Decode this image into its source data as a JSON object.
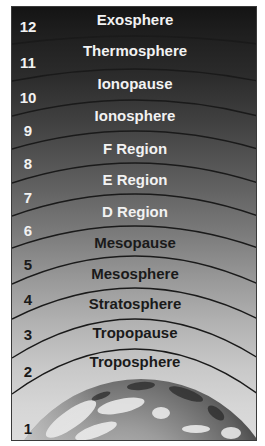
{
  "figure": {
    "colors": {
      "top": "#141414",
      "middle": "#7a7a7a",
      "bottom": "#dcdcdc",
      "arc_line": "#1a1a1a",
      "light_text": "#f2f2f2",
      "dark_text": "#1a1a1a"
    },
    "layers": [
      {
        "number": "12",
        "name": "Exosphere",
        "text_tone": "light"
      },
      {
        "number": "11",
        "name": "Thermosphere",
        "text_tone": "light"
      },
      {
        "number": "10",
        "name": "Ionopause",
        "text_tone": "light"
      },
      {
        "number": "9",
        "name": "Ionosphere",
        "text_tone": "light"
      },
      {
        "number": "8",
        "name": "F Region",
        "text_tone": "light"
      },
      {
        "number": "7",
        "name": "E Region",
        "text_tone": "light"
      },
      {
        "number": "6",
        "name": "D Region",
        "text_tone": "light"
      },
      {
        "number": "5",
        "name": "Mesopause",
        "text_tone": "dark"
      },
      {
        "number": "4",
        "name": "Mesosphere",
        "text_tone": "dark"
      },
      {
        "number": "3",
        "name": "Stratosphere",
        "text_tone": "dark"
      },
      {
        "number": "2",
        "name": "Tropopause",
        "text_tone": "dark"
      },
      {
        "number": "1",
        "name": "Troposphere",
        "text_tone": "dark"
      }
    ],
    "earth_label": "Earth (globe image)"
  }
}
